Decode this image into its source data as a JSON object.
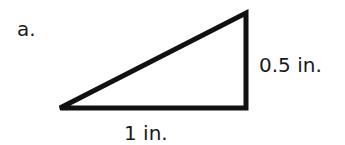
{
  "problem": {
    "label": "a."
  },
  "triangle": {
    "type": "right triangle",
    "base_label": "1 in.",
    "height_label": "0.5 in.",
    "stroke_color": "#111111",
    "vertices": [
      [
        60,
        108
      ],
      [
        246,
        108
      ],
      [
        246,
        13
      ]
    ]
  }
}
